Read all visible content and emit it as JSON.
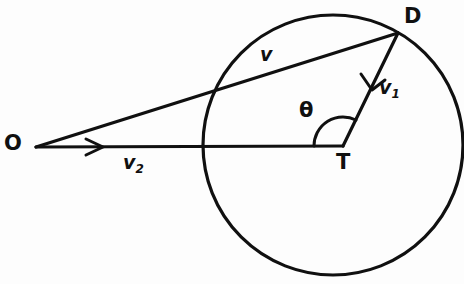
{
  "figure": {
    "type": "geometry-vector-diagram",
    "background_color": "#fdfdfd",
    "stroke_color": "#101010",
    "width": 464,
    "height": 284
  },
  "labels": {
    "origin": "O",
    "point_d": "D",
    "point_t": "T",
    "vector_resultant": "v",
    "vector_one_base": "v",
    "vector_one_sub": "1",
    "vector_two_base": "v",
    "vector_two_sub": "2",
    "angle": "θ"
  },
  "geometry": {
    "circle": {
      "cx": 333,
      "cy": 145,
      "r": 130
    },
    "points": {
      "O": {
        "x": 36,
        "y": 147
      },
      "D": {
        "x": 398,
        "y": 33
      },
      "T": {
        "x": 343,
        "y": 146
      }
    },
    "segments": [
      {
        "name": "O-D",
        "label": "v",
        "from": "O",
        "to": "D"
      },
      {
        "name": "O-T",
        "label": "v2",
        "from": "O",
        "to": "T",
        "arrow_at": {
          "x": 100,
          "y": 147
        }
      },
      {
        "name": "T-D",
        "label": "v1",
        "from": "T",
        "to": "D",
        "arrow_at": {
          "x": 372,
          "y": 86
        }
      }
    ],
    "angle_arc": {
      "vertex": "T",
      "radius": 29,
      "from_deg": 180,
      "to_deg": 64,
      "label": "θ"
    }
  }
}
